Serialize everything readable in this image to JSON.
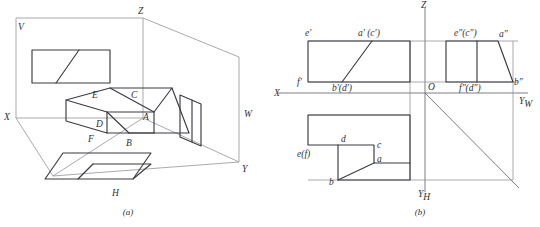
{
  "figure": {
    "captions": {
      "a": "(a)",
      "b": "(b)"
    }
  },
  "panel_a": {
    "name": "projection-box-pictorial",
    "plane_labels": {
      "v_plane": "V",
      "h_plane": "H",
      "w_plane": "W"
    },
    "axis_labels": {
      "x": "X",
      "y": "Y",
      "z": "Z"
    },
    "solid_vertex_labels": {
      "a": "A",
      "b": "B",
      "c": "C",
      "d": "D",
      "e": "E",
      "f": "F"
    }
  },
  "panel_b": {
    "name": "three-view-unfolded-layout",
    "axis_labels": {
      "x": "X",
      "z": "Z",
      "origin": "O",
      "y_w": "Y",
      "y_w_sub": "W",
      "y_h": "Y",
      "y_h_sub": "H"
    },
    "front_view_labels": {
      "e_prime": "e′",
      "a_prime_c_prime": "a′ (c′)",
      "f_prime": "f′",
      "b_prime_d_prime": "b′(d′)"
    },
    "side_view_labels": {
      "e_dprime_c_dprime": "e″(c″)",
      "a_dprime": "a″",
      "f_dprime_d_dprime": "f″(d″)",
      "b_dprime": "b″"
    },
    "top_view_labels": {
      "d": "d",
      "c": "c",
      "a": "a",
      "b": "b",
      "e_f": "e(f)"
    }
  },
  "colors": {
    "ink": "#2f2f36",
    "line": "#3b3b42",
    "thin_line": "#8e8e96",
    "axis_line": "#6e6e78",
    "background": "#ffffff"
  }
}
